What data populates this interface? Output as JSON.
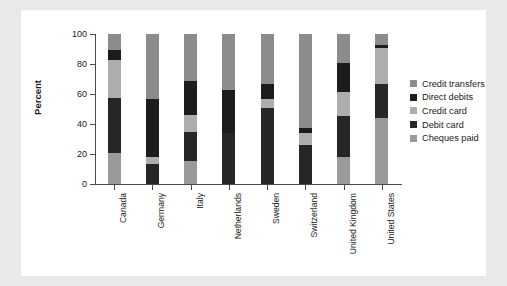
{
  "chart_data": {
    "type": "bar",
    "subtype": "stacked-bar-100",
    "title": "",
    "xlabel": "",
    "ylabel": "Percent",
    "ylim": [
      0,
      100
    ],
    "yticks": [
      0,
      20,
      40,
      60,
      80,
      100
    ],
    "ytick_labels": [
      "0",
      "20",
      "40",
      "60",
      "80",
      "100"
    ],
    "grid": false,
    "legend_position": "right",
    "units": "percent",
    "categories": [
      "Canada",
      "Germany",
      "Italy",
      "Netherlands",
      "Sweden",
      "Switzerland",
      "United Kingdom",
      "United States"
    ],
    "series": [
      {
        "name": "Cheques paid",
        "color": "#9a9a9a",
        "values": [
          20.5,
          0,
          15.5,
          0,
          0,
          0,
          18.0,
          44.0
        ]
      },
      {
        "name": "Debit card",
        "color": "#262626",
        "values": [
          37.0,
          13.5,
          19.0,
          34.0,
          50.5,
          26.0,
          27.5,
          23.0
        ]
      },
      {
        "name": "Credit card",
        "color": "#adadad",
        "values": [
          25.5,
          4.5,
          11.5,
          0,
          6.5,
          8.0,
          16.0,
          24.0
        ]
      },
      {
        "name": "Direct debits",
        "color": "#1c1c1c",
        "values": [
          6.5,
          39.0,
          22.5,
          29.0,
          10.0,
          3.5,
          19.5,
          2.0
        ]
      },
      {
        "name": "Credit transfers",
        "color": "#8c8c8c",
        "values": [
          10.5,
          43.0,
          31.5,
          37.0,
          33.0,
          62.5,
          19.0,
          7.0
        ]
      }
    ]
  },
  "legend": {
    "items": [
      {
        "label": "Credit transfers",
        "color": "#8c8c8c"
      },
      {
        "label": "Direct debits",
        "color": "#1c1c1c"
      },
      {
        "label": "Credit card",
        "color": "#adadad"
      },
      {
        "label": "Debit card",
        "color": "#262626"
      },
      {
        "label": "Cheques paid",
        "color": "#9a9a9a"
      }
    ]
  }
}
